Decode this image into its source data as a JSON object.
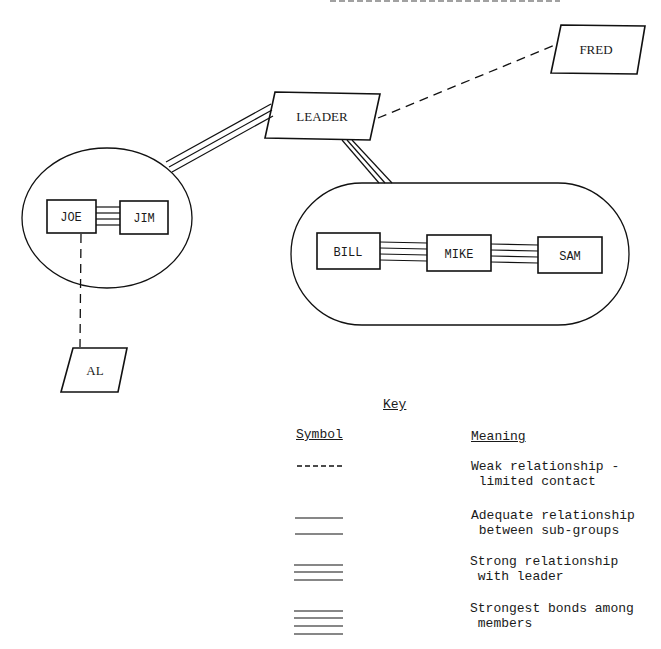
{
  "diagram": {
    "nodes": [
      {
        "id": "leader",
        "label": "LEADER",
        "shape": "parallelogram"
      },
      {
        "id": "fred",
        "label": "FRED",
        "shape": "parallelogram"
      },
      {
        "id": "joe",
        "label": "JOE",
        "shape": "rectangle",
        "group": "group-left"
      },
      {
        "id": "jim",
        "label": "JIM",
        "shape": "rectangle",
        "group": "group-left"
      },
      {
        "id": "al",
        "label": "AL",
        "shape": "parallelogram"
      },
      {
        "id": "bill",
        "label": "BILL",
        "shape": "rectangle",
        "group": "group-right"
      },
      {
        "id": "mike",
        "label": "MIKE",
        "shape": "rectangle",
        "group": "group-right"
      },
      {
        "id": "sam",
        "label": "SAM",
        "shape": "rectangle",
        "group": "group-right"
      }
    ],
    "groups": [
      {
        "id": "group-left",
        "shape": "circle",
        "members": [
          "joe",
          "jim"
        ]
      },
      {
        "id": "group-right",
        "shape": "stadium",
        "members": [
          "bill",
          "mike",
          "sam"
        ]
      }
    ],
    "edges": [
      {
        "from": "leader",
        "to": "fred",
        "type": "weak",
        "lines": "dashed"
      },
      {
        "from": "leader",
        "to": "group-left",
        "type": "strong",
        "lines": 3
      },
      {
        "from": "leader",
        "to": "group-right",
        "type": "strong",
        "lines": 3
      },
      {
        "from": "joe",
        "to": "jim",
        "type": "strongest",
        "lines": 4
      },
      {
        "from": "joe",
        "to": "al",
        "type": "weak",
        "lines": "dashed"
      },
      {
        "from": "bill",
        "to": "mike",
        "type": "strongest",
        "lines": 4
      },
      {
        "from": "mike",
        "to": "sam",
        "type": "strongest",
        "lines": 4
      }
    ]
  },
  "key": {
    "title": "Key",
    "symbol_header": "Symbol",
    "meaning_header": "Meaning",
    "entries": [
      {
        "symbol": "dashed",
        "meaning_line1": "Weak relationship -",
        "meaning_line2": " limited contact"
      },
      {
        "symbol": "2 lines",
        "meaning_line1": "Adequate relationship",
        "meaning_line2": " between sub-groups"
      },
      {
        "symbol": "3 lines",
        "meaning_line1": "Strong relationship",
        "meaning_line2": " with leader"
      },
      {
        "symbol": "4 lines",
        "meaning_line1": "Strongest bonds among",
        "meaning_line2": " members"
      }
    ]
  }
}
